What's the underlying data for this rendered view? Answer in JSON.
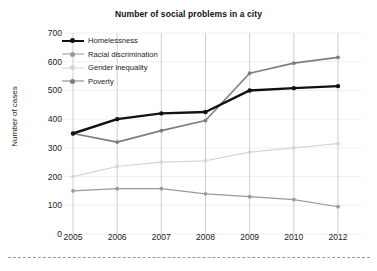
{
  "chart_data": {
    "type": "line",
    "title": "Number of social problems in a city",
    "xlabel": "",
    "ylabel": "Number of cases",
    "categories": [
      "2005",
      "2006",
      "2007",
      "2008",
      "2009",
      "2010",
      "2012"
    ],
    "ylim": [
      0,
      700
    ],
    "yticks": [
      "0",
      "100",
      "200",
      "300",
      "400",
      "500",
      "600",
      "700"
    ],
    "grid": "horizontal-faint-plus-category-droplines",
    "legend_position": "top-left-inside",
    "series": [
      {
        "name": "Homelessness",
        "color": "#111111",
        "values": [
          350,
          400,
          420,
          425,
          500,
          508,
          515
        ]
      },
      {
        "name": "Racial discrimination",
        "color": "#9a9a9a",
        "values": [
          150,
          158,
          158,
          140,
          130,
          120,
          95
        ]
      },
      {
        "name": "Gender inequality",
        "color": "#d5d5d5",
        "values": [
          200,
          235,
          250,
          255,
          285,
          300,
          315
        ]
      },
      {
        "name": "Poverty",
        "color": "#7d7d7d",
        "values": [
          350,
          320,
          360,
          395,
          560,
          595,
          615
        ]
      }
    ]
  },
  "legend": {
    "items": [
      {
        "label": "Homelessness"
      },
      {
        "label": "Racial discrimination"
      },
      {
        "label": "Gender inequality"
      },
      {
        "label": "Poverty"
      }
    ]
  }
}
